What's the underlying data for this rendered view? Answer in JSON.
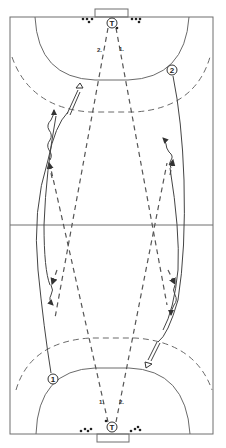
{
  "diagram": {
    "colors": {
      "lines": "#6e6e6e",
      "ink": "#333333",
      "background": "#ffffff"
    },
    "players": [
      {
        "id": "goalkeeper-top",
        "label": "T",
        "x": 112,
        "y": 23
      },
      {
        "id": "goalkeeper-bottom",
        "label": "T",
        "x": 112,
        "y": 427
      },
      {
        "id": "player-2",
        "label": "2",
        "x": 172,
        "y": 70
      },
      {
        "id": "player-1",
        "label": "1",
        "x": 53,
        "y": 379
      }
    ],
    "pass_labels": [
      {
        "id": "top-pass-2",
        "text": "2.",
        "x": 97,
        "y": 52
      },
      {
        "id": "top-pass-1",
        "text": "1.",
        "x": 119,
        "y": 51
      },
      {
        "id": "bottom-pass-1",
        "text": "1.",
        "x": 99,
        "y": 404
      },
      {
        "id": "bottom-pass-2",
        "text": "2.",
        "x": 119,
        "y": 404
      }
    ]
  }
}
